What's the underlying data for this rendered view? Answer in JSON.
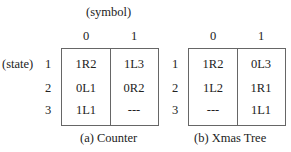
{
  "axis_labels": {
    "symbol": "(symbol)",
    "state": "(state)"
  },
  "tables": [
    {
      "caption": "(a) Counter",
      "columns": [
        "0",
        "1"
      ],
      "rows": [
        {
          "state": "1",
          "cells": [
            "1R2",
            "1L3"
          ]
        },
        {
          "state": "2",
          "cells": [
            "0L1",
            "0R2"
          ]
        },
        {
          "state": "3",
          "cells": [
            "1L1",
            "---"
          ]
        }
      ]
    },
    {
      "caption": "(b) Xmas Tree",
      "columns": [
        "0",
        "1"
      ],
      "rows": [
        {
          "state": "1",
          "cells": [
            "1R2",
            "0L3"
          ]
        },
        {
          "state": "2",
          "cells": [
            "1L2",
            "1R1"
          ]
        },
        {
          "state": "3",
          "cells": [
            "---",
            "1L1"
          ]
        }
      ]
    }
  ]
}
